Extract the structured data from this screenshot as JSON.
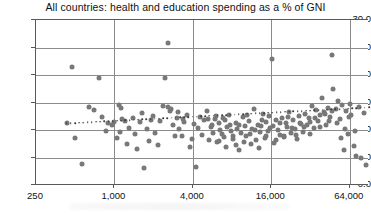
{
  "chart_data": {
    "type": "scatter",
    "title": "All countries: health and education spending as a % of GNI",
    "xlabel": "",
    "ylabel": "",
    "xscale": "log",
    "xlim": [
      250,
      90000
    ],
    "ylim": [
      0,
      30
    ],
    "grid": true,
    "legend": null,
    "xticks": [
      250,
      1000,
      4000,
      16000,
      64000
    ],
    "xtick_labels": [
      "250",
      "1,000",
      "4,000",
      "16,000",
      "64,000"
    ],
    "yticks": [
      0,
      5,
      10,
      15,
      20,
      25,
      30
    ],
    "ytick_labels": [
      "0.0",
      "5.0",
      "10.0",
      "15.0",
      "20.0",
      "25.0",
      "30.0"
    ],
    "marker_color": "#787878",
    "gridline_color": "#8c8c8e",
    "axis_color": "#59595b",
    "trendline": {
      "style": "dotted",
      "color": "#3c3c3c",
      "x": [
        430,
        90000
      ],
      "y": [
        11.2,
        14.1
      ],
      "note": "gently rising dotted fit line"
    },
    "points": [
      [
        430,
        11.3
      ],
      [
        470,
        21.5
      ],
      [
        500,
        8.5
      ],
      [
        560,
        3.9
      ],
      [
        640,
        14.1
      ],
      [
        700,
        13.6
      ],
      [
        760,
        19.4
      ],
      [
        800,
        12.3
      ],
      [
        860,
        9.9
      ],
      [
        900,
        11.2
      ],
      [
        950,
        10.9
      ],
      [
        1000,
        11.4
      ],
      [
        1050,
        8.6
      ],
      [
        1100,
        9.6
      ],
      [
        1150,
        12.0
      ],
      [
        1200,
        11.6
      ],
      [
        1250,
        7.4
      ],
      [
        1300,
        10.3
      ],
      [
        1380,
        12.2
      ],
      [
        1450,
        9.2
      ],
      [
        1500,
        6.6
      ],
      [
        1560,
        11.4
      ],
      [
        1620,
        13.1
      ],
      [
        1700,
        3.1
      ],
      [
        1780,
        10.2
      ],
      [
        1850,
        8.0
      ],
      [
        1900,
        11.9
      ],
      [
        1980,
        12.6
      ],
      [
        2050,
        9.4
      ],
      [
        2150,
        7.2
      ],
      [
        2250,
        11.7
      ],
      [
        2350,
        14.3
      ],
      [
        2450,
        19.4
      ],
      [
        2560,
        25.9
      ],
      [
        2700,
        13.9
      ],
      [
        2800,
        11.0
      ],
      [
        2900,
        8.9
      ],
      [
        3000,
        12.1
      ],
      [
        3150,
        10.1
      ],
      [
        3300,
        9.0
      ],
      [
        3450,
        11.5
      ],
      [
        3600,
        12.8
      ],
      [
        3800,
        6.9
      ],
      [
        3950,
        8.3
      ],
      [
        4100,
        11.1
      ],
      [
        4250,
        3.3
      ],
      [
        4400,
        10.4
      ],
      [
        4550,
        12.4
      ],
      [
        4700,
        9.1
      ],
      [
        4900,
        11.8
      ],
      [
        5100,
        13.4
      ],
      [
        5300,
        8.2
      ],
      [
        5500,
        10.6
      ],
      [
        5700,
        9.4
      ],
      [
        5900,
        12.0
      ],
      [
        6100,
        7.8
      ],
      [
        6300,
        11.3
      ],
      [
        6500,
        10.0
      ],
      [
        6700,
        9.2
      ],
      [
        6900,
        8.7
      ],
      [
        7100,
        11.9
      ],
      [
        7300,
        10.5
      ],
      [
        7600,
        12.7
      ],
      [
        7900,
        9.8
      ],
      [
        8200,
        8.4
      ],
      [
        8500,
        11.2
      ],
      [
        8800,
        10.1
      ],
      [
        9100,
        6.4
      ],
      [
        9400,
        9.5
      ],
      [
        9700,
        12.3
      ],
      [
        10000,
        10.8
      ],
      [
        10300,
        8.9
      ],
      [
        10700,
        11.6
      ],
      [
        11000,
        9.3
      ],
      [
        11400,
        10.2
      ],
      [
        11800,
        13.8
      ],
      [
        12200,
        8.1
      ],
      [
        12600,
        11.0
      ],
      [
        13000,
        9.7
      ],
      [
        13400,
        10.7
      ],
      [
        13800,
        12.9
      ],
      [
        14200,
        8.6
      ],
      [
        14700,
        11.4
      ],
      [
        15200,
        9.9
      ],
      [
        15700,
        10.4
      ],
      [
        16200,
        22.9
      ],
      [
        16800,
        7.6
      ],
      [
        17400,
        11.8
      ],
      [
        18000,
        10.0
      ],
      [
        18600,
        9.1
      ],
      [
        19200,
        12.1
      ],
      [
        19900,
        8.8
      ],
      [
        20600,
        11.3
      ],
      [
        21300,
        10.6
      ],
      [
        22000,
        13.3
      ],
      [
        22800,
        9.4
      ],
      [
        23600,
        11.9
      ],
      [
        24400,
        10.2
      ],
      [
        25200,
        8.3
      ],
      [
        26100,
        12.5
      ],
      [
        27000,
        11.1
      ],
      [
        28000,
        9.6
      ],
      [
        29000,
        13.0
      ],
      [
        30000,
        10.9
      ],
      [
        31000,
        12.2
      ],
      [
        32000,
        11.5
      ],
      [
        33000,
        14.4
      ],
      [
        34000,
        10.3
      ],
      [
        35200,
        13.6
      ],
      [
        36500,
        11.7
      ],
      [
        37800,
        12.8
      ],
      [
        39000,
        15.9
      ],
      [
        40500,
        13.2
      ],
      [
        42000,
        11.0
      ],
      [
        43500,
        14.0
      ],
      [
        45000,
        12.4
      ],
      [
        46500,
        23.7
      ],
      [
        48000,
        17.4
      ],
      [
        50000,
        13.9
      ],
      [
        52000,
        15.2
      ],
      [
        54000,
        12.0
      ],
      [
        56000,
        14.6
      ],
      [
        58000,
        6.3
      ],
      [
        60000,
        13.4
      ],
      [
        62000,
        9.2
      ],
      [
        64000,
        14.8
      ],
      [
        66000,
        12.7
      ],
      [
        69000,
        7.1
      ],
      [
        72000,
        5.2
      ],
      [
        75000,
        14.2
      ],
      [
        78000,
        5.0
      ],
      [
        82000,
        13.1
      ],
      [
        86000,
        3.6
      ],
      [
        1080,
        14.6
      ],
      [
        1120,
        14.0
      ],
      [
        2600,
        14.1
      ],
      [
        2680,
        13.5
      ],
      [
        3050,
        13.2
      ],
      [
        3380,
        12.0
      ],
      [
        5200,
        12.0
      ],
      [
        5600,
        11.0
      ],
      [
        6050,
        12.6
      ],
      [
        6400,
        8.0
      ],
      [
        6800,
        12.2
      ],
      [
        7200,
        7.0
      ],
      [
        7700,
        10.9
      ],
      [
        8100,
        9.0
      ],
      [
        8600,
        7.3
      ],
      [
        9000,
        11.0
      ],
      [
        9800,
        7.9
      ],
      [
        10500,
        12.8
      ],
      [
        11200,
        7.5
      ],
      [
        12000,
        10.0
      ],
      [
        12800,
        6.8
      ],
      [
        13600,
        11.8
      ],
      [
        14500,
        9.0
      ],
      [
        15500,
        12.6
      ],
      [
        16500,
        10.7
      ],
      [
        17500,
        8.2
      ],
      [
        18800,
        11.2
      ],
      [
        20000,
        9.0
      ],
      [
        21500,
        12.4
      ],
      [
        23000,
        10.4
      ],
      [
        24800,
        9.1
      ],
      [
        26500,
        11.3
      ],
      [
        28500,
        10.5
      ],
      [
        31500,
        9.3
      ],
      [
        34500,
        12.1
      ],
      [
        38000,
        10.6
      ],
      [
        41000,
        12.9
      ],
      [
        44000,
        11.6
      ],
      [
        47000,
        13.5
      ],
      [
        51000,
        11.2
      ],
      [
        55000,
        8.6
      ],
      [
        59000,
        10.1
      ],
      [
        63000,
        12.3
      ],
      [
        70000,
        9.9
      ]
    ]
  }
}
